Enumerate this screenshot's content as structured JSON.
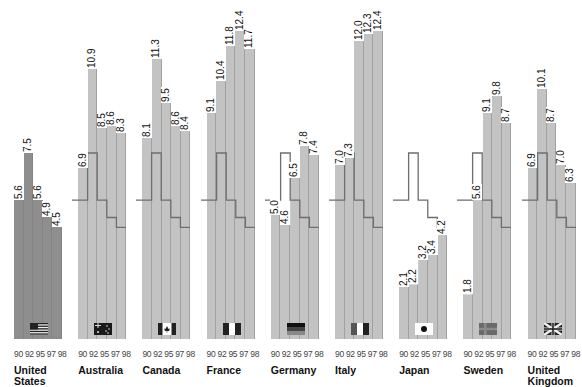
{
  "chart_data": {
    "type": "bar",
    "title": "",
    "xlabel": "",
    "ylabel": "",
    "categories": [
      "90",
      "92",
      "95",
      "97",
      "98"
    ],
    "reference_series": "United States",
    "series": [
      {
        "name": "United States",
        "values": [
          5.6,
          7.5,
          5.6,
          4.9,
          4.5
        ],
        "labels": [
          "5.6",
          "7.5",
          "5.6",
          "4.9",
          "4.5"
        ]
      },
      {
        "name": "Australia",
        "values": [
          6.9,
          10.9,
          8.5,
          8.6,
          8.3
        ],
        "labels": [
          "6.9",
          "10.9",
          "8.5",
          "8.6",
          "8.3"
        ]
      },
      {
        "name": "Canada",
        "values": [
          8.1,
          11.3,
          9.5,
          8.6,
          8.4
        ],
        "labels": [
          "8.1",
          "11.3",
          "9.5",
          "8.6",
          "8.4"
        ]
      },
      {
        "name": "France",
        "values": [
          9.1,
          10.4,
          11.8,
          12.4,
          11.7
        ],
        "labels": [
          "9.1",
          "10.4",
          "11.8",
          "12.4",
          "11.7"
        ]
      },
      {
        "name": "Germany",
        "values": [
          5.0,
          4.6,
          6.5,
          7.8,
          7.4
        ],
        "labels": [
          "5.0",
          "4.6",
          "6.5",
          "7.8",
          "7.4"
        ]
      },
      {
        "name": "Italy",
        "values": [
          7.0,
          7.3,
          12.0,
          12.3,
          12.4
        ],
        "labels": [
          "7.0",
          "7.3",
          "12.0",
          "12.3",
          "12.4"
        ]
      },
      {
        "name": "Japan",
        "values": [
          2.1,
          2.2,
          3.2,
          3.4,
          4.2
        ],
        "labels": [
          "2.1",
          "2.2",
          "3.2",
          "3.4",
          "4.2"
        ]
      },
      {
        "name": "Sweden",
        "values": [
          1.8,
          5.6,
          9.1,
          9.8,
          8.7
        ],
        "labels": [
          "1.8",
          "5.6",
          "9.1",
          "9.8",
          "8.7"
        ]
      },
      {
        "name": "United Kingdom",
        "values": [
          6.9,
          10.1,
          8.7,
          7.0,
          6.3
        ],
        "labels": [
          "6.9",
          "10.1",
          "8.7",
          "7.0",
          "6.3"
        ]
      }
    ],
    "grid": false,
    "legend": "none",
    "annotations": "US values drawn as step outline over each other country's bars"
  },
  "countries": [
    {
      "name_line1": "United",
      "name_line2": "States",
      "years": "90 92 95 97 98",
      "flag": "us-flag-icon"
    },
    {
      "name_line1": "Australia",
      "name_line2": "",
      "years": "90 92 95 97 98",
      "flag": "australia-flag-icon"
    },
    {
      "name_line1": "Canada",
      "name_line2": "",
      "years": "90 92 95 97 98",
      "flag": "canada-flag-icon"
    },
    {
      "name_line1": "France",
      "name_line2": "",
      "years": "90 92 95 97 98",
      "flag": "france-flag-icon"
    },
    {
      "name_line1": "Germany",
      "name_line2": "",
      "years": "90 92 95 97 98",
      "flag": "germany-flag-icon"
    },
    {
      "name_line1": "Italy",
      "name_line2": "",
      "years": "90 92 95 97 98",
      "flag": "italy-flag-icon"
    },
    {
      "name_line1": "Japan",
      "name_line2": "",
      "years": "90 92 95 97 98",
      "flag": "japan-flag-icon"
    },
    {
      "name_line1": "Sweden",
      "name_line2": "",
      "years": "90 92 95 97 98",
      "flag": "sweden-flag-icon"
    },
    {
      "name_line1": "United",
      "name_line2": "Kingdom",
      "years": "90 92 95 97 98",
      "flag": "uk-flag-icon"
    }
  ],
  "colors": {
    "us_bar": "#8e8e8e",
    "other_bar": "#c3c3c3",
    "reference_line": "#6e6e6e"
  }
}
